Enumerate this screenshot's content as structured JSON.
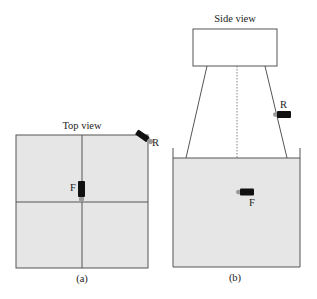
{
  "figure": {
    "panel_a": {
      "title": "Top view",
      "caption": "(a)",
      "camera_front_label": "F",
      "camera_rear_label": "R"
    },
    "panel_b": {
      "title": "Side view",
      "caption": "(b)",
      "camera_front_label": "F",
      "camera_rear_label": "R"
    }
  },
  "colors": {
    "water": "#e6e6e6",
    "line": "#444444",
    "camera_body": "#111111",
    "camera_lens": "#9a9a9a"
  }
}
